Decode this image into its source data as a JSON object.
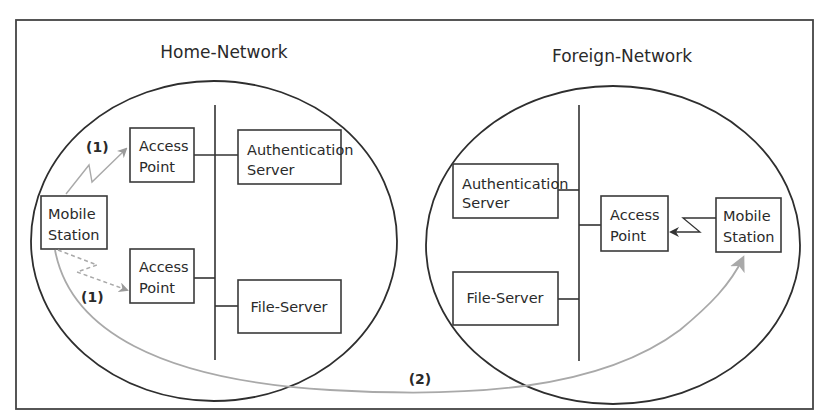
{
  "diagram": {
    "colors": {
      "line": "#333333",
      "handover_path": "#a9a9a9",
      "background": "#ffffff"
    },
    "home_network": {
      "title": "Home-Network",
      "mobile_station": {
        "line1": "Mobile",
        "line2": "Station"
      },
      "access_point_1": {
        "line1": "Access",
        "line2": "Point"
      },
      "access_point_2": {
        "line1": "Access",
        "line2": "Point"
      },
      "authentication_server": {
        "line1": "Authentication",
        "line2": "Server"
      },
      "file_server": {
        "label": "File-Server"
      },
      "step_label_top": "(1)",
      "step_label_bottom": "(1)"
    },
    "foreign_network": {
      "title": "Foreign-Network",
      "mobile_station": {
        "line1": "Mobile",
        "line2": "Station"
      },
      "access_point": {
        "line1": "Access",
        "line2": "Point"
      },
      "authentication_server": {
        "line1": "Authentication",
        "line2": "Server"
      },
      "file_server": {
        "label": "File-Server"
      }
    },
    "roaming_step_label": "(2)"
  }
}
